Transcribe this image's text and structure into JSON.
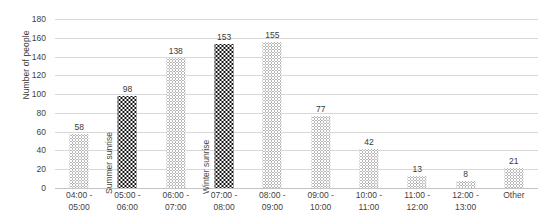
{
  "chart_data": {
    "type": "bar",
    "title": "",
    "xlabel": "",
    "ylabel": "Number of people",
    "ylim": [
      0,
      180
    ],
    "ytick_step": 20,
    "yticks": [
      "180",
      "160",
      "140",
      "120",
      "100",
      "80",
      "60",
      "40",
      "20",
      "0"
    ],
    "grid": true,
    "legend": "none",
    "categories": [
      "04:00 - 05:00",
      "05:00 - 06:00",
      "06:00 - 07:00",
      "07:00 - 08:00",
      "08:00 - 09:00",
      "09:00 - 10:00",
      "10:00 - 11:00",
      "11:00 - 12:00",
      "12:00 - 13:00",
      "Other"
    ],
    "category_lines": [
      [
        "04:00 -",
        "05:00"
      ],
      [
        "05:00 -",
        "06:00"
      ],
      [
        "06:00 -",
        "07:00"
      ],
      [
        "07:00 -",
        "08:00"
      ],
      [
        "08:00 -",
        "09:00"
      ],
      [
        "09:00 -",
        "10:00"
      ],
      [
        "10:00 -",
        "11:00"
      ],
      [
        "11:00 -",
        "12:00"
      ],
      [
        "12:00 -",
        "13:00"
      ],
      [
        "Other",
        ""
      ]
    ],
    "values": [
      58,
      98,
      138,
      153,
      155,
      77,
      42,
      13,
      8,
      21
    ],
    "value_labels": [
      "58",
      "98",
      "138",
      "153",
      "155",
      "77",
      "42",
      "13",
      "8",
      "21"
    ],
    "bar_styles": [
      "light",
      "dark",
      "light",
      "dark",
      "light",
      "light",
      "light",
      "light",
      "light",
      "light"
    ],
    "annotations": [
      {
        "text": "Summer sunrise",
        "at_category": "05:00 - 06:00"
      },
      {
        "text": "Winter sunrise",
        "at_category": "07:00 - 08:00"
      }
    ],
    "colors": {
      "bar_light": "#6d6d6d",
      "bar_dark": "#121212",
      "gridline": "#d8d8d8",
      "text": "#3f3f3f",
      "background": "#ffffff"
    }
  }
}
